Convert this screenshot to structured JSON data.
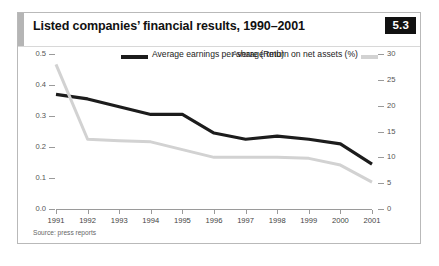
{
  "figure": {
    "title": "Listed companies’ financial results, 1990–2001",
    "badge": "5.3",
    "source": "Source: press reports"
  },
  "legend": {
    "dark_label": "Average earnings per share (Rmb)",
    "light_label": "Average return on net assets (%)",
    "dark_color": "#1c1c1c",
    "light_color": "#d2d2d2"
  },
  "chart_data": {
    "type": "line",
    "title": "Listed companies’ financial results, 1990–2001",
    "xlabel": "",
    "ylabel": "Average earnings per share (Rmb)",
    "ylabel_right": "Average return on net assets (%)",
    "grid": false,
    "legend_position": "top",
    "categories": [
      "1991",
      "1992",
      "1993",
      "1994",
      "1995",
      "1996",
      "1997",
      "1998",
      "1999",
      "2000",
      "2001"
    ],
    "ylim": [
      0,
      0.5
    ],
    "ylim_right": [
      0,
      30
    ],
    "yticks": [
      "0.0",
      "0.1",
      "0.2",
      "0.3",
      "0.4",
      "0.5"
    ],
    "ytick_values": [
      0.0,
      0.1,
      0.2,
      0.3,
      0.4,
      0.5
    ],
    "yticks_right": [
      "0",
      "5",
      "10",
      "15",
      "20",
      "25",
      "30"
    ],
    "ytick_values_right": [
      0,
      5,
      10,
      15,
      20,
      25,
      30
    ],
    "series": [
      {
        "name": "Average earnings per share (Rmb)",
        "axis": "left",
        "color": "#1c1c1c",
        "values": [
          0.37,
          0.355,
          0.33,
          0.305,
          0.305,
          0.245,
          0.225,
          0.235,
          0.225,
          0.21,
          0.145
        ]
      },
      {
        "name": "Average return on net assets (%)",
        "axis": "right",
        "color": "#d2d2d2",
        "values": [
          28.0,
          13.5,
          13.2,
          13.0,
          11.5,
          10.0,
          10.0,
          10.0,
          9.8,
          8.5,
          5.2
        ]
      }
    ]
  }
}
